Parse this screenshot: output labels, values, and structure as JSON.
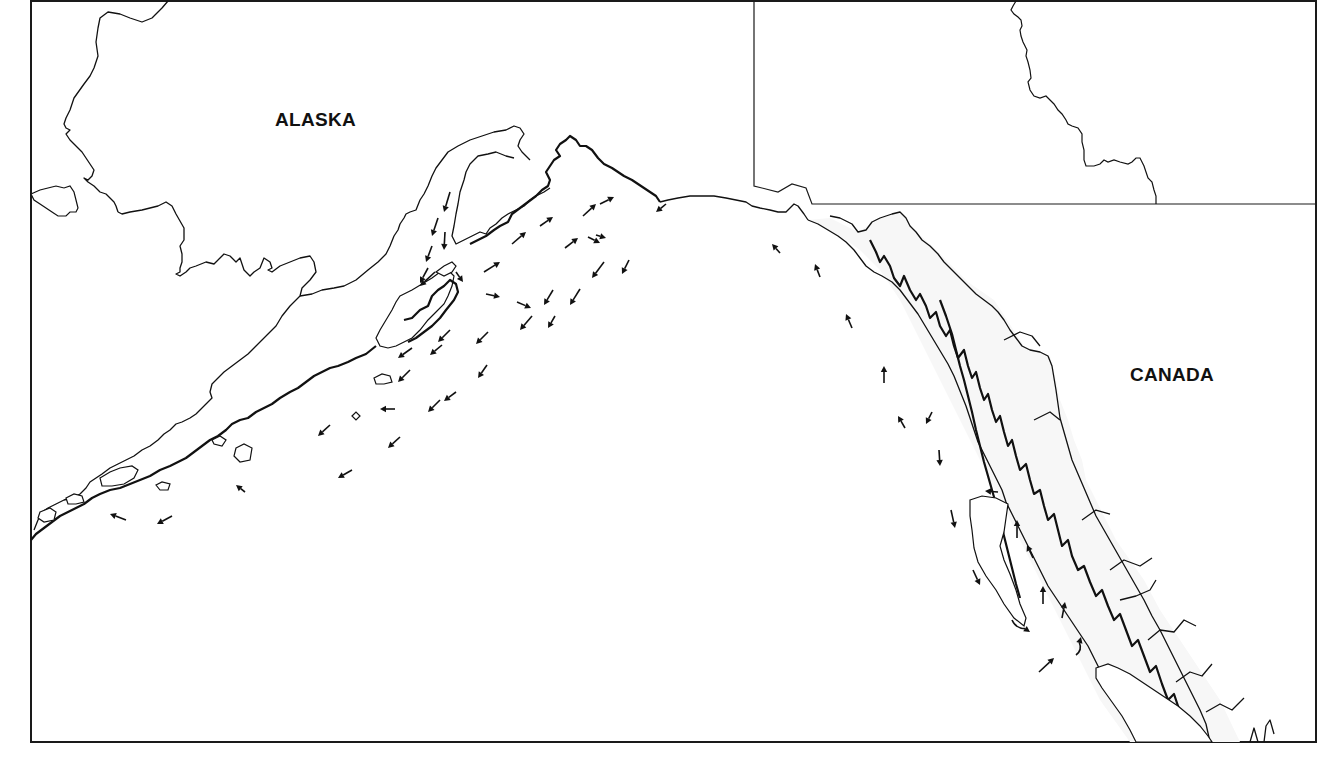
{
  "map": {
    "labels": {
      "alaska": "ALASKA",
      "canada": "CANADA"
    },
    "label_positions": {
      "alaska": {
        "x": 275,
        "y": 126
      },
      "canada": {
        "x": 1130,
        "y": 381
      }
    },
    "colors": {
      "ink": "#111111",
      "background": "#ffffff",
      "land_tint": "#f7f7f7"
    },
    "frame": {
      "x": 30,
      "y": 0,
      "width": 1286,
      "height": 742
    },
    "inset_box": {
      "x": 754,
      "y": 0,
      "width": 562,
      "height": 204
    },
    "current_arrows": [
      {
        "x1": 450,
        "y1": 192,
        "x2": 444,
        "y2": 212,
        "curved": false
      },
      {
        "x1": 438,
        "y1": 218,
        "x2": 432,
        "y2": 236,
        "curved": false
      },
      {
        "x1": 445,
        "y1": 232,
        "x2": 444,
        "y2": 250,
        "curved": false
      },
      {
        "x1": 432,
        "y1": 246,
        "x2": 426,
        "y2": 262,
        "curved": false
      },
      {
        "x1": 428,
        "y1": 268,
        "x2": 420,
        "y2": 283,
        "curved": false
      },
      {
        "x1": 435,
        "y1": 272,
        "x2": 420,
        "y2": 286,
        "curved": false
      },
      {
        "x1": 456,
        "y1": 272,
        "x2": 463,
        "y2": 282,
        "curved": false
      },
      {
        "x1": 484,
        "y1": 272,
        "x2": 500,
        "y2": 262,
        "curved": false
      },
      {
        "x1": 512,
        "y1": 244,
        "x2": 526,
        "y2": 232,
        "curved": false
      },
      {
        "x1": 540,
        "y1": 226,
        "x2": 553,
        "y2": 217,
        "curved": false
      },
      {
        "x1": 565,
        "y1": 248,
        "x2": 578,
        "y2": 238,
        "curved": false
      },
      {
        "x1": 583,
        "y1": 216,
        "x2": 596,
        "y2": 204,
        "curved": false
      },
      {
        "x1": 600,
        "y1": 204,
        "x2": 614,
        "y2": 197,
        "curved": false
      },
      {
        "x1": 596,
        "y1": 235,
        "x2": 606,
        "y2": 238,
        "curved": false
      },
      {
        "x1": 588,
        "y1": 237,
        "x2": 600,
        "y2": 243,
        "curved": false
      },
      {
        "x1": 604,
        "y1": 262,
        "x2": 592,
        "y2": 278,
        "curved": false
      },
      {
        "x1": 629,
        "y1": 260,
        "x2": 622,
        "y2": 274,
        "curved": false
      },
      {
        "x1": 486,
        "y1": 294,
        "x2": 500,
        "y2": 297,
        "curved": false
      },
      {
        "x1": 517,
        "y1": 302,
        "x2": 531,
        "y2": 308,
        "curved": false
      },
      {
        "x1": 553,
        "y1": 290,
        "x2": 544,
        "y2": 305,
        "curved": false
      },
      {
        "x1": 580,
        "y1": 289,
        "x2": 570,
        "y2": 305,
        "curved": false
      },
      {
        "x1": 532,
        "y1": 316,
        "x2": 520,
        "y2": 330,
        "curved": false
      },
      {
        "x1": 555,
        "y1": 316,
        "x2": 548,
        "y2": 328,
        "curved": false
      },
      {
        "x1": 488,
        "y1": 332,
        "x2": 476,
        "y2": 344,
        "curved": false
      },
      {
        "x1": 450,
        "y1": 330,
        "x2": 438,
        "y2": 342,
        "curved": false
      },
      {
        "x1": 442,
        "y1": 345,
        "x2": 430,
        "y2": 355,
        "curved": false
      },
      {
        "x1": 412,
        "y1": 348,
        "x2": 398,
        "y2": 358,
        "curved": false
      },
      {
        "x1": 410,
        "y1": 370,
        "x2": 398,
        "y2": 382,
        "curved": false
      },
      {
        "x1": 487,
        "y1": 365,
        "x2": 478,
        "y2": 378,
        "curved": false
      },
      {
        "x1": 456,
        "y1": 392,
        "x2": 444,
        "y2": 401,
        "curved": false
      },
      {
        "x1": 395,
        "y1": 409,
        "x2": 380,
        "y2": 409,
        "curved": false
      },
      {
        "x1": 440,
        "y1": 400,
        "x2": 428,
        "y2": 412,
        "curved": false
      },
      {
        "x1": 330,
        "y1": 425,
        "x2": 318,
        "y2": 436,
        "curved": false
      },
      {
        "x1": 400,
        "y1": 437,
        "x2": 388,
        "y2": 448,
        "curved": false
      },
      {
        "x1": 352,
        "y1": 470,
        "x2": 338,
        "y2": 478,
        "curved": false
      },
      {
        "x1": 245,
        "y1": 492,
        "x2": 236,
        "y2": 485,
        "curved": false
      },
      {
        "x1": 126,
        "y1": 520,
        "x2": 110,
        "y2": 514,
        "curved": false
      },
      {
        "x1": 172,
        "y1": 516,
        "x2": 157,
        "y2": 524,
        "curved": false
      },
      {
        "x1": 666,
        "y1": 204,
        "x2": 656,
        "y2": 212,
        "curved": false
      },
      {
        "x1": 780,
        "y1": 253,
        "x2": 772,
        "y2": 244,
        "curved": false
      },
      {
        "x1": 820,
        "y1": 277,
        "x2": 815,
        "y2": 264,
        "curved": false
      },
      {
        "x1": 852,
        "y1": 328,
        "x2": 846,
        "y2": 314,
        "curved": false
      },
      {
        "x1": 884,
        "y1": 383,
        "x2": 884,
        "y2": 366,
        "curved": false
      },
      {
        "x1": 905,
        "y1": 428,
        "x2": 898,
        "y2": 416,
        "curved": false
      },
      {
        "x1": 932,
        "y1": 412,
        "x2": 926,
        "y2": 424,
        "curved": false
      },
      {
        "x1": 939,
        "y1": 450,
        "x2": 940,
        "y2": 466,
        "curved": false
      },
      {
        "x1": 998,
        "y1": 492,
        "x2": 985,
        "y2": 491,
        "curved": false
      },
      {
        "x1": 951,
        "y1": 510,
        "x2": 955,
        "y2": 528,
        "curved": false
      },
      {
        "x1": 1017,
        "y1": 538,
        "x2": 1017,
        "y2": 520,
        "curved": false
      },
      {
        "x1": 1033,
        "y1": 558,
        "x2": 1027,
        "y2": 545,
        "curved": false
      },
      {
        "x1": 973,
        "y1": 570,
        "x2": 980,
        "y2": 585,
        "curved": false
      },
      {
        "x1": 1043,
        "y1": 604,
        "x2": 1043,
        "y2": 586,
        "curved": false
      },
      {
        "x1": 1062,
        "y1": 618,
        "x2": 1065,
        "y2": 602,
        "curved": false
      },
      {
        "x1": 1012,
        "y1": 620,
        "x2": 1030,
        "y2": 632,
        "curved": true
      },
      {
        "x1": 1076,
        "y1": 655,
        "x2": 1081,
        "y2": 637,
        "curved": true
      },
      {
        "x1": 1039,
        "y1": 672,
        "x2": 1054,
        "y2": 658,
        "curved": false
      }
    ]
  }
}
